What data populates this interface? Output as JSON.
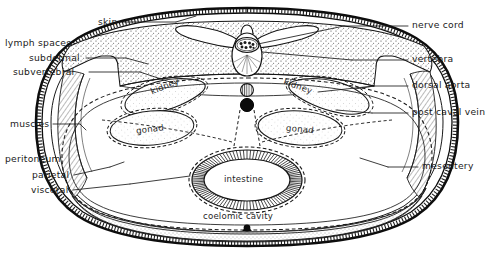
{
  "figure": {
    "background_color": "#ffffff",
    "ink_color": "#141414"
  },
  "labels_left": [
    {
      "id": "lymph-spaces",
      "text": "lymph spaces",
      "group": true,
      "x": 5,
      "y": 42,
      "leader": false
    },
    {
      "id": "subdermal",
      "text": "subdermal",
      "group": false,
      "x": 29,
      "y": 57,
      "leader": true
    },
    {
      "id": "subvertebral",
      "text": "subvertebral",
      "group": false,
      "x": 13,
      "y": 71,
      "leader": true
    },
    {
      "id": "muscles",
      "text": "muscles",
      "group": false,
      "x": 10,
      "y": 122,
      "leader": true
    },
    {
      "id": "peritoneum",
      "text": "peritoneum",
      "group": true,
      "x": 5,
      "y": 158,
      "leader": false
    },
    {
      "id": "parietal",
      "text": "parietal",
      "group": false,
      "x": 32,
      "y": 173,
      "leader": true
    },
    {
      "id": "visceral",
      "text": "visceral",
      "group": false,
      "x": 31,
      "y": 188,
      "leader": true
    }
  ],
  "labels_right": [
    {
      "id": "nerve-cord",
      "text": "nerve cord",
      "x": 412,
      "y": 23
    },
    {
      "id": "vertebra",
      "text": "vertebra",
      "x": 412,
      "y": 57
    },
    {
      "id": "dorsal-aorta",
      "text": "dorsal aorta",
      "x": 412,
      "y": 83
    },
    {
      "id": "post-caval-vein",
      "text": "post caval vein",
      "x": 412,
      "y": 110
    },
    {
      "id": "mesentery",
      "text": "mesentery",
      "x": 422,
      "y": 164
    }
  ],
  "labels_top": [
    {
      "id": "skin",
      "text": "skin",
      "x": 98,
      "y": 20
    }
  ],
  "organ_labels": [
    {
      "id": "kidney-left",
      "text": "kidney",
      "x": 150,
      "y": 86,
      "rotate": -22
    },
    {
      "id": "kidney-right",
      "text": "kidney",
      "x": 283,
      "y": 86,
      "rotate": 20
    },
    {
      "id": "gonad-left",
      "text": "gonad",
      "x": 148,
      "y": 128,
      "rotate": -7
    },
    {
      "id": "gonad-right",
      "text": "gonad",
      "x": 297,
      "y": 128,
      "rotate": 5
    },
    {
      "id": "intestine",
      "text": "intestine",
      "x": 224,
      "y": 176,
      "rotate": 0
    },
    {
      "id": "coelomic-cavity",
      "text": "coelomic cavity",
      "x": 203,
      "y": 214,
      "rotate": 0
    }
  ],
  "structures": {
    "skin": "outer thick double contour with fine cross-hatch ticks",
    "subdermal_lymph": "narrow clear band beneath skin",
    "muscle_block": "stippled dorsal mass with oblique hatching laterally",
    "vertebra": "central dorsal vertebra with transverse processes and neural canal",
    "nerve_cord": "granular oval inside neural canal",
    "dorsal_aorta": "small vertically hatched circle below vertebra",
    "post_caval_vein": "small solid black circle below dorsal aorta",
    "kidneys": "paired elongated dashed-outline organs flanking the midline",
    "gonads": "paired oval dashed-outline organs ventro-lateral",
    "intestine": "central ventral oval with radial hatched wall and dashed serosa",
    "mesentery": "dashed membrane suspending gut from dorsal body wall",
    "coelomic_cavity": "large clear ventral cavity",
    "ventral_keel": "small solid black node at ventral midline"
  }
}
